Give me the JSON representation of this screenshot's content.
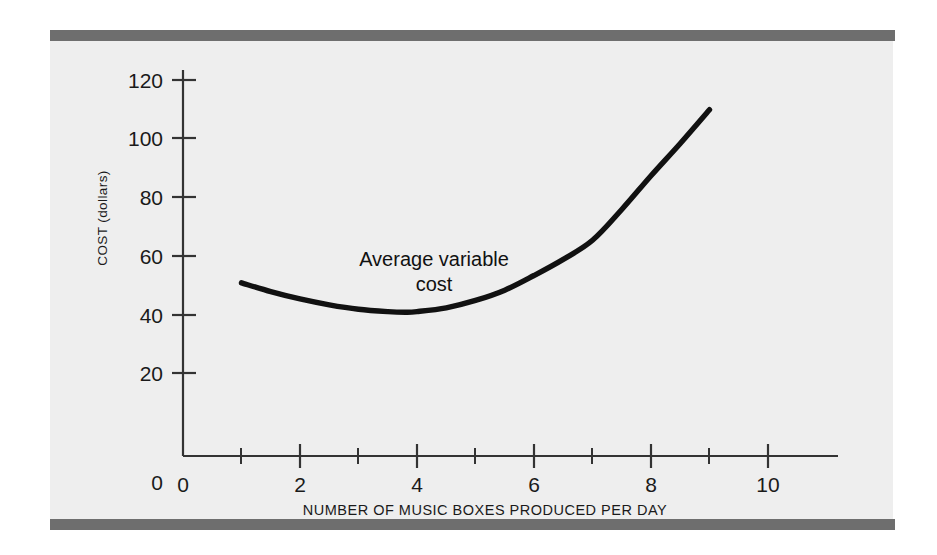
{
  "figure": {
    "background_color": "#eeeeee",
    "page_color": "#ffffff",
    "rule_color": "#6e6e6e",
    "axis_color": "#333333",
    "curve_color": "#111111"
  },
  "chart_data": {
    "type": "line",
    "title": "",
    "xlabel": "NUMBER OF MUSIC BOXES PRODUCED PER DAY",
    "ylabel": "COST (dollars)",
    "xlim": [
      0,
      11.2
    ],
    "ylim": [
      0,
      132
    ],
    "grid": false,
    "legend": "none",
    "x_ticks_major": [
      0,
      2,
      4,
      6,
      8,
      10
    ],
    "x_tick_labels": [
      "0",
      "2",
      "4",
      "6",
      "8",
      "10"
    ],
    "x_ticks_minor": [
      1,
      3,
      5,
      7,
      9
    ],
    "y_ticks_major": [
      0,
      20,
      40,
      60,
      80,
      100,
      120
    ],
    "y_tick_labels": [
      "0",
      "20",
      "40",
      "60",
      "80",
      "100",
      "120"
    ],
    "series": [
      {
        "name": "Average variable cost",
        "label_line1": "Average variable",
        "label_line2": "cost",
        "x": [
          1.0,
          1.5,
          2.0,
          2.5,
          3.0,
          3.5,
          3.8,
          4.0,
          4.5,
          5.0,
          5.5,
          6.0,
          6.5,
          7.0,
          7.5,
          8.0,
          8.5,
          9.0
        ],
        "y": [
          59.0,
          56.0,
          53.5,
          51.5,
          50.0,
          49.2,
          49.0,
          49.2,
          50.5,
          53.0,
          56.5,
          61.5,
          67.0,
          73.5,
          84.0,
          95.5,
          106.5,
          118.0
        ]
      }
    ]
  }
}
